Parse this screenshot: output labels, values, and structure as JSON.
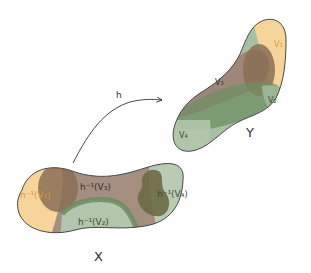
{
  "diagram": {
    "map": {
      "label": "h"
    },
    "domain_set": {
      "label": "X",
      "regions": [
        {
          "id": "pre_v1",
          "label": "h⁻¹(V₁)",
          "color": "#f6d49a"
        },
        {
          "id": "pre_v2",
          "label": "h⁻¹(V₂)",
          "color": "#a9bfa4"
        },
        {
          "id": "pre_v3",
          "label": "h⁻¹(V₃)",
          "color": "#9e877a"
        },
        {
          "id": "pre_v4",
          "label": "h⁻¹(V₄)",
          "color": "#b6c9b2"
        }
      ]
    },
    "codomain_set": {
      "label": "Y",
      "regions": [
        {
          "id": "v1",
          "label": "V₁",
          "color": "#f6d49a"
        },
        {
          "id": "v2",
          "label": "V₂",
          "color": "#7f9e74"
        },
        {
          "id": "v3",
          "label": "V₃",
          "color": "#9e877a"
        },
        {
          "id": "v4",
          "label": "V₄",
          "color": "#a9bfa4"
        }
      ]
    },
    "outline_color": "#4a4a4a"
  }
}
